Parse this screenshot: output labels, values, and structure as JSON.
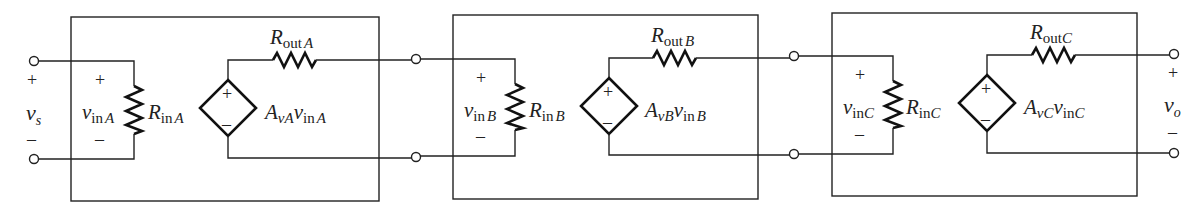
{
  "source": {
    "voltage_label": "v",
    "voltage_sub": "s",
    "plus": "+",
    "minus": "–"
  },
  "output": {
    "voltage_label": "v",
    "voltage_sub": "o",
    "plus": "+",
    "minus": "–"
  },
  "stages": [
    {
      "id": "A",
      "vin_main": "v",
      "vin_sub": "in",
      "vin_sub2": "A",
      "rin_main": "R",
      "rin_sub": "in",
      "rin_sub2": "A",
      "rout_main": "R",
      "rout_sub": "out",
      "rout_sub2": "A",
      "gain_main": "A",
      "gain_sub": "v",
      "gain_sub2": "A",
      "gain_v": "v",
      "gain_v_sub": "in",
      "gain_v_sub2": "A",
      "plus": "+",
      "minus": "–"
    },
    {
      "id": "B",
      "vin_main": "v",
      "vin_sub": "in",
      "vin_sub2": "B",
      "rin_main": "R",
      "rin_sub": "in",
      "rin_sub2": "B",
      "rout_main": "R",
      "rout_sub": "out",
      "rout_sub2": "B",
      "gain_main": "A",
      "gain_sub": "v",
      "gain_sub2": "B",
      "gain_v": "v",
      "gain_v_sub": "in",
      "gain_v_sub2": "B",
      "plus": "+",
      "minus": "–"
    },
    {
      "id": "C",
      "vin_main": "v",
      "vin_sub": "in",
      "vin_sub2": "C",
      "rin_main": "R",
      "rin_sub": "in",
      "rin_sub2": "C",
      "rout_main": "R",
      "rout_sub": "out",
      "rout_sub2": "C",
      "gain_main": "A",
      "gain_sub": "v",
      "gain_sub2": "C",
      "gain_v": "v",
      "gain_v_sub": "in",
      "gain_v_sub2": "C",
      "plus": "+",
      "minus": "–"
    }
  ]
}
